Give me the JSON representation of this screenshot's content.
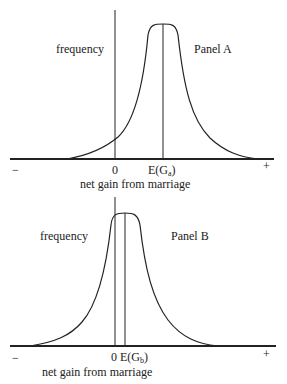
{
  "panel_a": {
    "title": "Panel A",
    "y_label": "frequency",
    "x_label": "net gain from marriage",
    "minus": "−",
    "plus": "+",
    "zero": "0",
    "mean_label_main": "E(G",
    "mean_label_sub": "a",
    "mean_label_close": ")"
  },
  "panel_b": {
    "title": "Panel B",
    "y_label": "frequency",
    "x_label": "net gain from marriage",
    "minus": "−",
    "plus": "+",
    "zero": "0",
    "mean_label_main": "E(G",
    "mean_label_sub": "b",
    "mean_label_close": ")"
  },
  "colors": {
    "line": "#222222",
    "background": "#ffffff"
  }
}
